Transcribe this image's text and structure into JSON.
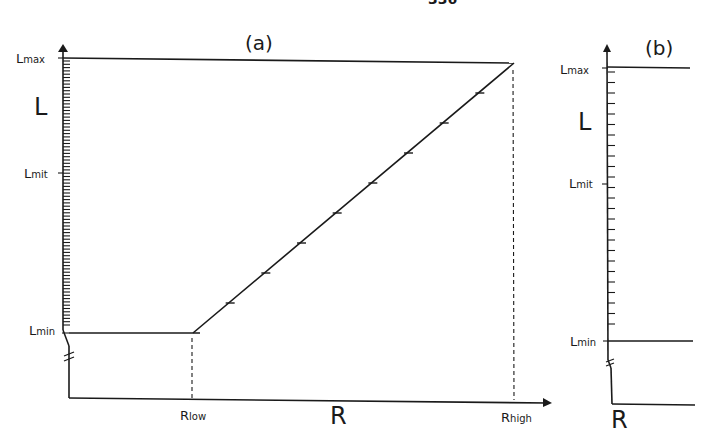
{
  "page": {
    "page_number_partial": "336"
  },
  "chart_data": [
    {
      "type": "line",
      "panel": "(a)",
      "title": "(a)",
      "xlabel": "R",
      "ylabel": "L",
      "x_ticks": [
        {
          "label": "R",
          "sub": "low",
          "position": "R_low"
        },
        {
          "label": "R",
          "sub": "high",
          "position": "R_high"
        }
      ],
      "y_ticks": [
        {
          "label": "L",
          "sub": "max"
        },
        {
          "label": "L",
          "sub": "mit"
        },
        {
          "label": "L",
          "sub": "min"
        }
      ],
      "series": [
        {
          "name": "L(R) mapping",
          "points": [
            {
              "x": "0",
              "y": "L_min"
            },
            {
              "x": "R_low",
              "y": "L_min"
            },
            {
              "x": "R_high",
              "y": "L_max"
            }
          ]
        },
        {
          "name": "upper bound",
          "points": [
            {
              "x": "0",
              "y": "L_max"
            },
            {
              "x": "R_high",
              "y": "L_max"
            }
          ]
        }
      ],
      "dashed_verticals": [
        "R_low",
        "R_high"
      ],
      "y_axis_break": true,
      "y_minor_ticks": "dense (quantized levels between L_min and L_max)",
      "diagonal_tick_count": 8,
      "grid": false,
      "legend": null
    },
    {
      "type": "line",
      "panel": "(b)",
      "title": "(b)",
      "xlabel": "R",
      "ylabel": "L",
      "y_ticks": [
        {
          "label": "L",
          "sub": "max"
        },
        {
          "label": "L",
          "sub": "mit"
        },
        {
          "label": "L",
          "sub": "min"
        }
      ],
      "series": [
        {
          "name": "L_max level",
          "points": [
            {
              "x": "0",
              "y": "L_max"
            },
            {
              "x": "end",
              "y": "L_max"
            }
          ]
        },
        {
          "name": "L_min level",
          "points": [
            {
              "x": "0",
              "y": "L_min"
            },
            {
              "x": "end",
              "y": "L_min"
            }
          ]
        }
      ],
      "y_axis_break": true,
      "y_minor_ticks": "sparse (coarser quantized levels)",
      "grid": false,
      "legend": null
    }
  ],
  "labels": {
    "a": {
      "title": "(a)",
      "y_axis": "L",
      "x_axis": "R",
      "lmax": {
        "main": "L",
        "sub": "max"
      },
      "lmit": {
        "main": "L",
        "sub": "mit"
      },
      "lmin": {
        "main": "L",
        "sub": "min"
      },
      "rlow": {
        "main": "R",
        "sub": "low"
      },
      "rhigh": {
        "main": "R",
        "sub": "high"
      }
    },
    "b": {
      "title": "(b)",
      "y_axis": "L",
      "x_axis": "R",
      "lmax": {
        "main": "L",
        "sub": "max"
      },
      "lmit": {
        "main": "L",
        "sub": "mit"
      },
      "lmin": {
        "main": "L",
        "sub": "min"
      }
    }
  }
}
